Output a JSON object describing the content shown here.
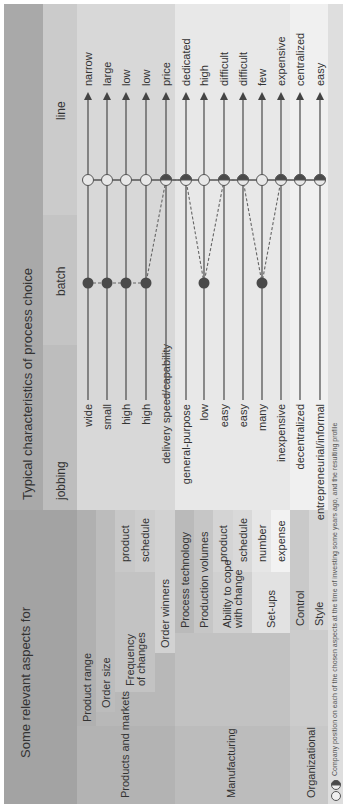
{
  "header": {
    "left_title": "Some relevant aspects for",
    "right_title": "Typical characteristics of process choice",
    "columns": [
      "jobbing",
      "batch",
      "line"
    ]
  },
  "groups": [
    {
      "label": "Products and markets"
    },
    {
      "label": "Manufacturing"
    },
    {
      "label": "Organizational"
    }
  ],
  "rows": [
    {
      "aspect": "Product range",
      "sub": "",
      "left": "wide",
      "right": "narrow",
      "company": "batch",
      "line_marker": "open"
    },
    {
      "aspect": "Order size",
      "sub": "",
      "left": "small",
      "right": "large",
      "company": "batch",
      "line_marker": "open"
    },
    {
      "aspect": "Frequency of changes",
      "sub": "product",
      "left": "high",
      "right": "low",
      "company": "batch",
      "line_marker": "open"
    },
    {
      "aspect": "",
      "sub": "schedule",
      "left": "high",
      "right": "low",
      "company": "batch",
      "line_marker": "open"
    },
    {
      "aspect": "Order winners",
      "sub": "",
      "left": "delivery speed/capability",
      "right": "price",
      "company": "line",
      "line_marker": "half"
    },
    {
      "aspect": "Process technology",
      "sub": "",
      "left": "general-purpose",
      "right": "dedicated",
      "company": "line",
      "line_marker": "half"
    },
    {
      "aspect": "Production volumes",
      "sub": "",
      "left": "low",
      "right": "high",
      "company": "batch",
      "line_marker": "open"
    },
    {
      "aspect": "Ability to cope with change",
      "sub": "product",
      "left": "easy",
      "right": "difficult",
      "company": "line",
      "line_marker": "half"
    },
    {
      "aspect": "",
      "sub": "schedule",
      "left": "easy",
      "right": "difficult",
      "company": "line",
      "line_marker": "half"
    },
    {
      "aspect": "Set-ups",
      "sub": "number",
      "left": "many",
      "right": "few",
      "company": "batch",
      "line_marker": "open"
    },
    {
      "aspect": "",
      "sub": "expense",
      "left": "inexpensive",
      "right": "expensive",
      "company": "line",
      "line_marker": "half"
    },
    {
      "aspect": "Control",
      "sub": "",
      "left": "decentralized",
      "right": "centralized",
      "company": "line",
      "line_marker": "half"
    },
    {
      "aspect": "Style",
      "sub": "",
      "left": "entrepreneurial/informal",
      "right": "easy",
      "company": "line",
      "line_marker": "half"
    }
  ],
  "aspect_labels": {
    "product_range": "Product range",
    "order_size": "Order size",
    "frequency_l1": "Frequency",
    "frequency_l2": "of changes",
    "order_winners": "Order winners",
    "process_technology": "Process technology",
    "production_volumes": "Production volumes",
    "ability_l1": "Ability to cope",
    "ability_l2": "with change",
    "setups": "Set-ups",
    "control": "Control",
    "style": "Style"
  },
  "legend": {
    "caption": "Company position on each of the chosen aspects at the time of investing some years ago, and the resulting profile"
  },
  "colors": {
    "left_header": "#a3a3a3",
    "right_header": "#a9a9a9",
    "products_group": "#b8b8b8",
    "manufacturing_group": "#c4c4c4",
    "organizational_group": "#cfcfcf",
    "dot_fill": "#4a4a4a",
    "line": "#555555"
  }
}
